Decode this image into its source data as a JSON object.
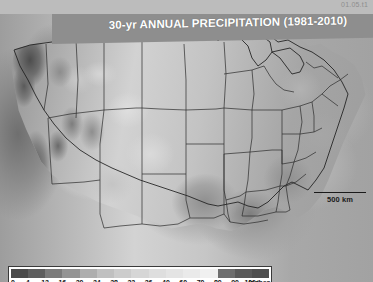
{
  "corner_code": "01.05.t1",
  "map": {
    "title": "30-yr ANNUAL PRECIPITATION (1981-2010)",
    "scalebar_label": "500 km",
    "projection_region": "Contiguous United States"
  },
  "legend": {
    "unit_label": "inches",
    "ticks": [
      "0",
      "4",
      "12",
      "16",
      "20",
      "24",
      "28",
      "32",
      "36",
      "40",
      "60",
      "70",
      "80",
      "90",
      "100+"
    ],
    "swatch_colors": [
      "#4a4a4a",
      "#5e5e5e",
      "#7b7b7b",
      "#949494",
      "#aeaeae",
      "#c0c0c0",
      "#cccccc",
      "#d6d6d6",
      "#dedede",
      "#e4e4e4",
      "#eaeaea",
      "#f0f0f0",
      "#6e6e6e",
      "#5a5a5a",
      "#4f4f4f"
    ]
  },
  "chart_data": {
    "type": "heatmap",
    "title": "30-yr ANNUAL PRECIPITATION (1981-2010)",
    "xlabel": "",
    "ylabel": "",
    "colorbar_label": "inches",
    "colorbar_ticks": [
      0,
      4,
      12,
      16,
      20,
      24,
      28,
      32,
      36,
      40,
      60,
      70,
      80,
      90,
      100
    ],
    "colorbar_tick_labels": [
      "0",
      "4",
      "12",
      "16",
      "20",
      "24",
      "28",
      "32",
      "36",
      "40",
      "60",
      "70",
      "80",
      "90",
      "100+"
    ],
    "scale_bar_km": 500,
    "grid": false,
    "legend_position": "bottom-left"
  }
}
